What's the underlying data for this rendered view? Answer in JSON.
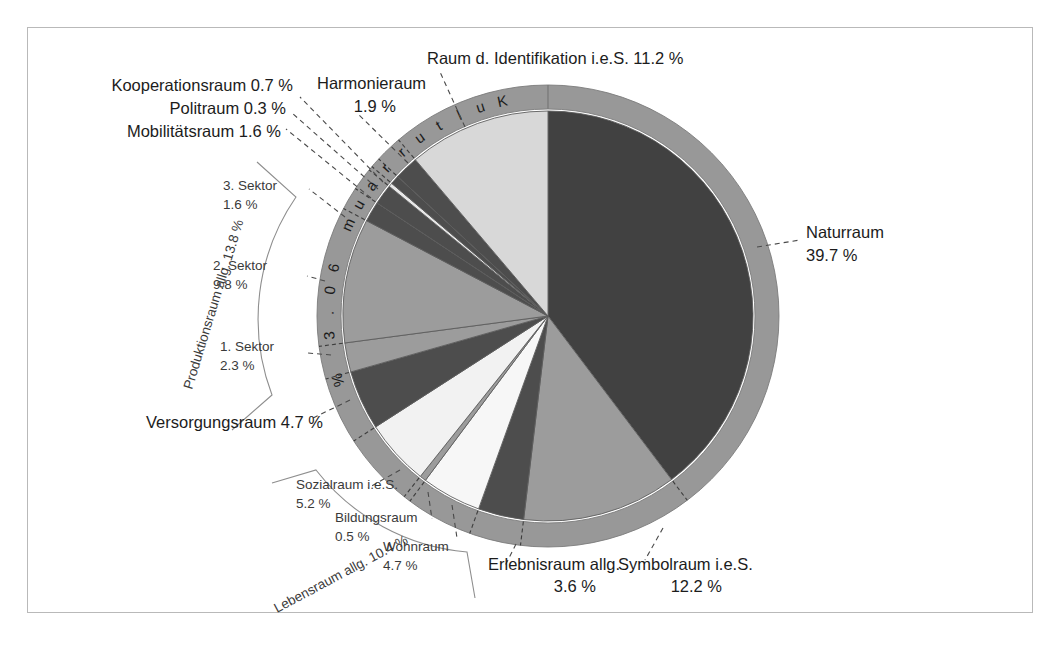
{
  "figure": {
    "title": "",
    "center": {
      "x": 548,
      "y": 316
    },
    "radius_pie": 205,
    "radius_ring_inner": 207,
    "radius_ring_outer": 231
  },
  "ring": {
    "label": "K u l t u r r a u m   6 0 . 3  %",
    "text": "Kulturraum 60.3 %",
    "value": 60.3,
    "color": "#989898"
  },
  "colors": {
    "dark": "#414141",
    "mid_dark": "#4d4d4d",
    "mid": "#9c9c9c",
    "ring": "#989898",
    "light": "#d8d8d8",
    "lighter": "#eaeaea",
    "white": "#fbfbfb",
    "outline": "#5d5d5d"
  },
  "chart_data": {
    "type": "pie",
    "unit": "%",
    "start_angle_deg": -90,
    "direction": "clockwise",
    "total": 100.0,
    "categories": [
      "Naturraum",
      "Symbolraum i.e.S.",
      "Erlebnisraum allg.",
      "Wohnraum",
      "Bildungsraum",
      "Sozialraum i.e.S.",
      "Versorgungsraum",
      "1. Sektor",
      "2. Sektor",
      "3. Sektor",
      "Mobilitätsraum",
      "Politraum",
      "Kooperationsraum",
      "Harmonieraum",
      "Raum d. Identifikation i.e.S."
    ],
    "values": [
      39.7,
      12.2,
      3.6,
      4.7,
      0.5,
      5.2,
      4.7,
      2.3,
      9.8,
      1.6,
      1.6,
      0.3,
      0.7,
      1.9,
      11.2
    ],
    "colors": [
      "#414141",
      "#9c9c9c",
      "#4d4d4d",
      "#f7f7f7",
      "#9c9c9c",
      "#f2f2f2",
      "#4d4d4d",
      "#9c9c9c",
      "#9c9c9c",
      "#4d4d4d",
      "#4d4d4d",
      "#e8e8e8",
      "#4d4d4d",
      "#4d4d4d",
      "#d8d8d8"
    ],
    "legend": "none",
    "grid": false
  },
  "labels": {
    "naturraum": {
      "name": "Naturraum",
      "value": "39.7 %"
    },
    "symbolraum": {
      "name": "Symbolraum i.e.S.",
      "value": "12.2 %"
    },
    "erlebnisraum": {
      "name": "Erlebnisraum allg.",
      "value": "3.6 %"
    },
    "wohnraum": {
      "name": "Wohnraum",
      "value": "4.7 %"
    },
    "bildungsraum": {
      "name": "Bildungsraum",
      "value": "0.5 %"
    },
    "sozialraum": {
      "name": "Sozialraum i.e.S.",
      "value": "5.2 %"
    },
    "versorgungsraum": {
      "name": "Versorgungsraum 4.7 %"
    },
    "sektor1": {
      "name": "1. Sektor",
      "value": "2.3 %"
    },
    "sektor2": {
      "name": "2. Sektor",
      "value": "9.8 %"
    },
    "sektor3": {
      "name": "3. Sektor",
      "value": "1.6 %"
    },
    "mobilitaetsraum": {
      "name": "Mobilitätsraum 1.6 %"
    },
    "politraum": {
      "name": "Politraum 0.3 %"
    },
    "kooperationsraum": {
      "name": "Kooperationsraum 0.7 %"
    },
    "harmonieraum": {
      "name": "Harmonieraum",
      "value": "1.9 %"
    },
    "identifikation": {
      "name": "Raum d. Identifikation i.e.S. 11.2 %"
    }
  },
  "brackets": {
    "produktionsraum": {
      "label": "Produktionsraum allg. 13.8 %",
      "value": 13.8
    },
    "lebensraum": {
      "label": "Lebensraum allg. 10.4 %",
      "value": 10.4
    }
  }
}
